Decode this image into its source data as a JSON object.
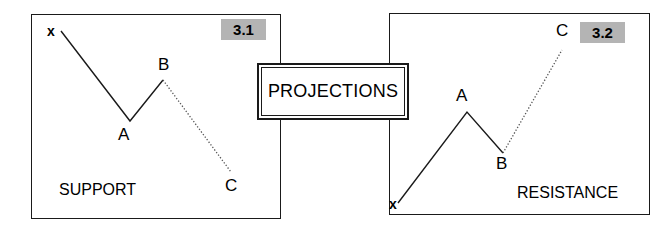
{
  "figure": {
    "center_box": {
      "label": "PROJECTIONS"
    },
    "panels": [
      {
        "id": "support",
        "badge": "3.1",
        "caption": "SUPPORT",
        "points": [
          {
            "name": "x",
            "label": "x"
          },
          {
            "name": "A",
            "label": "A"
          },
          {
            "name": "B",
            "label": "B"
          },
          {
            "name": "C",
            "label": "C"
          }
        ]
      },
      {
        "id": "resistance",
        "badge": "3.2",
        "caption": "RESISTANCE",
        "points": [
          {
            "name": "x",
            "label": "x"
          },
          {
            "name": "A",
            "label": "A"
          },
          {
            "name": "B",
            "label": "B"
          },
          {
            "name": "C",
            "label": "C"
          }
        ]
      }
    ]
  },
  "chart_data": [
    {
      "type": "line",
      "title": "3.1",
      "subtitle": "SUPPORT",
      "xlabel": "",
      "ylabel": "",
      "grid": false,
      "legend": "none",
      "xlim": [
        31,
        281
      ],
      "ylim": [
        14,
        219
      ],
      "annotations": [
        "x",
        "A",
        "B",
        "C",
        "SUPPORT",
        "3.1"
      ],
      "series": [
        {
          "name": "observed-swing",
          "style": "solid",
          "color": "#1a1a1a",
          "points": [
            {
              "label": "x",
              "x": 61,
              "y": 31
            },
            {
              "label": "A",
              "x": 130,
              "y": 121
            },
            {
              "label": "B",
              "x": 163,
              "y": 80
            }
          ]
        },
        {
          "name": "projected-leg",
          "style": "dotted",
          "color": "#555555",
          "points": [
            {
              "label": "B",
              "x": 163,
              "y": 80
            },
            {
              "label": "C",
              "x": 231,
              "y": 172
            }
          ]
        }
      ]
    },
    {
      "type": "line",
      "title": "3.2",
      "subtitle": "RESISTANCE",
      "xlabel": "",
      "ylabel": "",
      "grid": false,
      "legend": "none",
      "xlim": [
        389,
        650
      ],
      "ylim": [
        13,
        215
      ],
      "annotations": [
        "x",
        "A",
        "B",
        "C",
        "RESISTANCE",
        "3.2"
      ],
      "series": [
        {
          "name": "observed-swing",
          "style": "solid",
          "color": "#1a1a1a",
          "points": [
            {
              "label": "x",
              "x": 398,
              "y": 203
            },
            {
              "label": "A",
              "x": 467,
              "y": 112
            },
            {
              "label": "B",
              "x": 503,
              "y": 153
            }
          ]
        },
        {
          "name": "projected-leg",
          "style": "dotted",
          "color": "#555555",
          "points": [
            {
              "label": "B",
              "x": 503,
              "y": 153
            },
            {
              "label": "C",
              "x": 562,
              "y": 50
            }
          ]
        }
      ]
    }
  ]
}
